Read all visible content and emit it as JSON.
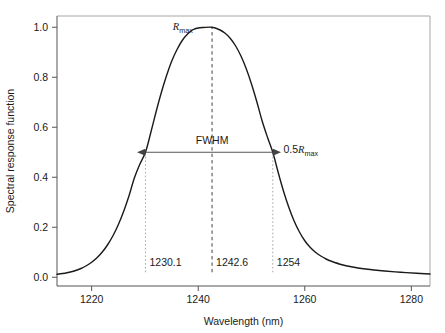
{
  "chart_data": {
    "type": "line",
    "title": "",
    "xlabel": "Wavelength (nm)",
    "ylabel": "Spectral response function",
    "xlim": [
      1213.5,
      1283.5
    ],
    "ylim": [
      -0.035,
      1.045
    ],
    "xticks": [
      "1220",
      "1240",
      "1260",
      "1280"
    ],
    "xtick_values": [
      1220,
      1240,
      1260,
      1280
    ],
    "yticks": [
      "0.0",
      "0.2",
      "0.4",
      "0.6",
      "0.8",
      "1.0"
    ],
    "ytick_values": [
      0.0,
      0.2,
      0.4,
      0.6,
      0.8,
      1.0
    ],
    "grid": false,
    "legend": "none",
    "line_color": "#1a1a1a",
    "series": [
      {
        "name": "Spectral response function",
        "x": [
          1213.5,
          1215,
          1216,
          1217,
          1218,
          1219,
          1220,
          1221,
          1222,
          1223,
          1224,
          1225,
          1226,
          1227,
          1228,
          1229,
          1230.1,
          1231,
          1232,
          1233,
          1234,
          1235,
          1236,
          1237,
          1238,
          1239,
          1240,
          1241,
          1242.6,
          1244,
          1245,
          1246,
          1247,
          1248,
          1249,
          1250,
          1251,
          1252,
          1253,
          1254,
          1255,
          1256,
          1257,
          1258,
          1259,
          1260,
          1261,
          1262,
          1263,
          1264,
          1265,
          1267,
          1269,
          1271,
          1273,
          1275,
          1278,
          1281,
          1283.5
        ],
        "y": [
          0.012,
          0.016,
          0.021,
          0.027,
          0.035,
          0.046,
          0.06,
          0.078,
          0.101,
          0.13,
          0.166,
          0.21,
          0.263,
          0.325,
          0.396,
          0.45,
          0.5,
          0.57,
          0.654,
          0.733,
          0.803,
          0.863,
          0.91,
          0.947,
          0.973,
          0.99,
          0.997,
          0.999,
          1.0,
          0.99,
          0.977,
          0.956,
          0.926,
          0.886,
          0.835,
          0.773,
          0.702,
          0.625,
          0.56,
          0.5,
          0.42,
          0.345,
          0.28,
          0.225,
          0.181,
          0.146,
          0.12,
          0.1,
          0.085,
          0.073,
          0.064,
          0.05,
          0.041,
          0.034,
          0.029,
          0.025,
          0.02,
          0.016,
          0.013
        ]
      }
    ],
    "annotations": [
      {
        "name": "peak-label",
        "text": "Rmax",
        "text_base": "R",
        "text_sub": "max",
        "x": 1239.0,
        "y": 1.0
      },
      {
        "name": "fwhm-label",
        "text": "FWHM",
        "x": 1242.6,
        "y": 0.53
      },
      {
        "name": "half-max-label",
        "text": "0.5Rmax",
        "text_prefix": "0.5",
        "text_base": "R",
        "text_sub": "max",
        "x": 1256.0,
        "y": 0.5
      }
    ],
    "markers": {
      "left_half": {
        "label": "1230.1",
        "value": 1230.1
      },
      "peak": {
        "label": "1242.6",
        "value": 1242.6
      },
      "right_half": {
        "label": "1254",
        "value": 1254
      },
      "half_max_level": 0.5,
      "marker_label_y": 0.045
    },
    "fwhm": {
      "from": 1230.1,
      "to": 1254,
      "width": 23.9,
      "level": 0.5
    }
  },
  "style": {
    "background": "#ffffff",
    "frame_color": "#9a9a9a",
    "axis_color": "#555555",
    "curve_color": "#1a1a1a",
    "dotted_marker_color": "#a8a8a8",
    "peak_dash_color": "#444444",
    "arrow_color": "#555555"
  }
}
